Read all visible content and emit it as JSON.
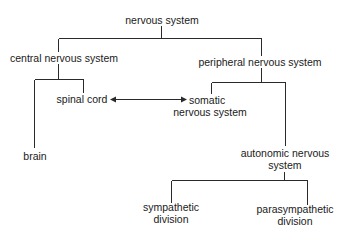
{
  "diagram": {
    "root": {
      "label": "nervous system"
    },
    "central": {
      "label": "central nervous system"
    },
    "peripheral": {
      "label": "peripheral nervous system"
    },
    "brain": {
      "label": "brain"
    },
    "spinal_cord": {
      "label": "spinal cord"
    },
    "somatic": {
      "line1": "somatic",
      "line2": "nervous system"
    },
    "autonomic": {
      "line1": "autonomic nervous",
      "line2": "system"
    },
    "sympathetic": {
      "line1": "sympathetic",
      "line2": "division"
    },
    "parasympathetic": {
      "line1": "parasympathetic",
      "line2": "division"
    },
    "connections": [
      {
        "from": "nervous system",
        "to": "central nervous system",
        "type": "tree"
      },
      {
        "from": "nervous system",
        "to": "peripheral nervous system",
        "type": "tree"
      },
      {
        "from": "central nervous system",
        "to": "brain",
        "type": "tree"
      },
      {
        "from": "central nervous system",
        "to": "spinal cord",
        "type": "tree"
      },
      {
        "from": "peripheral nervous system",
        "to": "somatic nervous system",
        "type": "tree"
      },
      {
        "from": "peripheral nervous system",
        "to": "autonomic nervous system",
        "type": "tree"
      },
      {
        "from": "autonomic nervous system",
        "to": "sympathetic division",
        "type": "tree"
      },
      {
        "from": "autonomic nervous system",
        "to": "parasympathetic division",
        "type": "tree"
      },
      {
        "from": "spinal cord",
        "to": "somatic nervous system",
        "type": "bidirectional-arrow"
      }
    ],
    "line_color": "#2a2a2a"
  }
}
